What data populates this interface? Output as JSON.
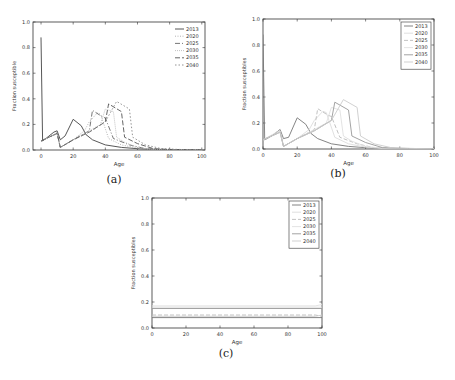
{
  "chart_data": [
    {
      "id": "a",
      "caption": "(a)",
      "type": "line",
      "title": "",
      "xlabel": "Age",
      "ylabel": "Fraction susceptible",
      "xlim": [
        -5,
        102
      ],
      "ylim": [
        0,
        1.0
      ],
      "xticks": [
        0,
        20,
        40,
        60,
        80,
        100
      ],
      "yticks": [
        0.0,
        0.2,
        0.4,
        0.6,
        0.8,
        1.0
      ],
      "grid": false,
      "legend_position": "upper right",
      "legend_frame": false,
      "box": {
        "x": 33,
        "y": 22,
        "w": 172,
        "h": 128
      },
      "series": [
        {
          "name": "2013",
          "dash": "",
          "color": "#444444",
          "x": [
            0,
            1,
            3,
            8,
            10,
            12,
            15,
            20,
            25,
            28,
            32,
            40,
            50,
            60,
            70,
            100
          ],
          "y": [
            0.88,
            0.07,
            0.09,
            0.14,
            0.15,
            0.08,
            0.11,
            0.24,
            0.19,
            0.12,
            0.08,
            0.04,
            0.02,
            0.01,
            0.005,
            0.0
          ]
        },
        {
          "name": "2020",
          "dash": "1,1.5",
          "color": "#aaaaaa",
          "x": [
            0,
            8,
            10,
            12,
            20,
            27,
            30,
            35,
            37,
            42,
            50,
            60,
            70,
            100
          ],
          "y": [
            0.07,
            0.12,
            0.14,
            0.02,
            0.08,
            0.15,
            0.22,
            0.29,
            0.28,
            0.09,
            0.04,
            0.015,
            0.005,
            0.0
          ]
        },
        {
          "name": "2025",
          "dash": "5,2,1,2",
          "color": "#666666",
          "x": [
            0,
            10,
            12,
            20,
            30,
            32,
            38,
            40,
            45,
            55,
            65,
            75,
            100
          ],
          "y": [
            0.07,
            0.13,
            0.02,
            0.08,
            0.15,
            0.31,
            0.26,
            0.25,
            0.09,
            0.04,
            0.01,
            0.005,
            0.0
          ]
        },
        {
          "name": "2030",
          "dash": "1,1",
          "color": "#bbbbbb",
          "x": [
            0,
            10,
            12,
            20,
            30,
            37,
            40,
            45,
            47,
            52,
            60,
            70,
            100
          ],
          "y": [
            0.07,
            0.13,
            0.02,
            0.08,
            0.15,
            0.2,
            0.32,
            0.3,
            0.1,
            0.06,
            0.02,
            0.005,
            0.0
          ]
        },
        {
          "name": "2035",
          "dash": "5,2",
          "color": "#555555",
          "x": [
            0,
            10,
            12,
            20,
            30,
            40,
            42,
            50,
            52,
            60,
            70,
            80,
            100
          ],
          "y": [
            0.07,
            0.13,
            0.02,
            0.08,
            0.14,
            0.22,
            0.36,
            0.3,
            0.1,
            0.05,
            0.01,
            0.005,
            0.0
          ]
        },
        {
          "name": "2040",
          "dash": "1.5,2",
          "color": "#888888",
          "x": [
            0,
            10,
            12,
            20,
            30,
            40,
            47,
            55,
            57,
            65,
            75,
            85,
            100
          ],
          "y": [
            0.07,
            0.13,
            0.02,
            0.08,
            0.14,
            0.22,
            0.38,
            0.32,
            0.1,
            0.04,
            0.01,
            0.005,
            0.0
          ]
        }
      ]
    },
    {
      "id": "b",
      "caption": "(b)",
      "type": "line",
      "title": "",
      "xlabel": "Age",
      "ylabel": "Fraction susceptibles",
      "xlim": [
        0,
        100
      ],
      "ylim": [
        0,
        1.0
      ],
      "xticks": [
        0,
        20,
        40,
        60,
        80,
        100
      ],
      "yticks": [
        0.0,
        0.2,
        0.4,
        0.6,
        0.8,
        1.0
      ],
      "grid": false,
      "legend_position": "upper right",
      "legend_frame": true,
      "box": {
        "x": 263,
        "y": 19,
        "w": 171,
        "h": 130
      },
      "series": [
        {
          "name": "2013",
          "dash": "",
          "color": "#777777",
          "x": [
            0,
            1,
            5,
            10,
            12,
            15,
            20,
            25,
            28,
            32,
            40,
            50,
            60,
            70,
            100
          ],
          "y": [
            0.88,
            0.07,
            0.1,
            0.15,
            0.08,
            0.09,
            0.24,
            0.19,
            0.12,
            0.08,
            0.04,
            0.02,
            0.01,
            0.005,
            0.0
          ]
        },
        {
          "name": "2020",
          "dash": "",
          "color": "#dddddd",
          "x": [
            0,
            8,
            10,
            12,
            20,
            27,
            30,
            35,
            37,
            42,
            50,
            60,
            70,
            100
          ],
          "y": [
            0.07,
            0.13,
            0.14,
            0.02,
            0.08,
            0.15,
            0.22,
            0.29,
            0.28,
            0.09,
            0.04,
            0.015,
            0.005,
            0.0
          ]
        },
        {
          "name": "2025",
          "dash": "4,2",
          "color": "#bbbbbb",
          "x": [
            0,
            10,
            12,
            20,
            30,
            32,
            38,
            40,
            45,
            55,
            65,
            75,
            100
          ],
          "y": [
            0.07,
            0.13,
            0.02,
            0.08,
            0.15,
            0.31,
            0.26,
            0.25,
            0.09,
            0.04,
            0.01,
            0.005,
            0.0
          ]
        },
        {
          "name": "2030",
          "dash": "",
          "color": "#e0e0e0",
          "x": [
            0,
            10,
            12,
            20,
            30,
            37,
            40,
            45,
            47,
            52,
            60,
            70,
            100
          ],
          "y": [
            0.07,
            0.13,
            0.02,
            0.08,
            0.15,
            0.2,
            0.32,
            0.3,
            0.1,
            0.06,
            0.02,
            0.005,
            0.0
          ]
        },
        {
          "name": "2035",
          "dash": "",
          "color": "#999999",
          "x": [
            0,
            10,
            12,
            20,
            30,
            40,
            42,
            50,
            52,
            60,
            70,
            80,
            100
          ],
          "y": [
            0.07,
            0.13,
            0.02,
            0.08,
            0.14,
            0.22,
            0.36,
            0.3,
            0.1,
            0.05,
            0.01,
            0.005,
            0.0
          ]
        },
        {
          "name": "2040",
          "dash": "",
          "color": "#cccccc",
          "x": [
            0,
            10,
            12,
            20,
            30,
            40,
            47,
            55,
            57,
            65,
            75,
            85,
            100
          ],
          "y": [
            0.07,
            0.13,
            0.02,
            0.08,
            0.14,
            0.22,
            0.38,
            0.32,
            0.1,
            0.04,
            0.01,
            0.005,
            0.0
          ]
        }
      ]
    },
    {
      "id": "c",
      "caption": "(c)",
      "type": "line",
      "title": "",
      "xlabel": "Age",
      "ylabel": "Fraction susceptibles",
      "xlim": [
        0,
        100
      ],
      "ylim": [
        0,
        1.0
      ],
      "xticks": [
        0,
        20,
        40,
        60,
        80,
        100
      ],
      "yticks": [
        0.0,
        0.2,
        0.4,
        0.6,
        0.8,
        1.0
      ],
      "grid": false,
      "legend_position": "upper right",
      "legend_frame": true,
      "box": {
        "x": 152,
        "y": 198,
        "w": 170,
        "h": 130
      },
      "series": [
        {
          "name": "2013",
          "dash": "",
          "color": "#777777",
          "x": [
            0,
            100
          ],
          "y": [
            0.08,
            0.08
          ]
        },
        {
          "name": "2020",
          "dash": "",
          "color": "#dddddd",
          "x": [
            0,
            100
          ],
          "y": [
            0.16,
            0.16
          ]
        },
        {
          "name": "2025",
          "dash": "4,2",
          "color": "#bbbbbb",
          "x": [
            0,
            96,
            100
          ],
          "y": [
            0.1,
            0.1,
            0.09
          ]
        },
        {
          "name": "2030",
          "dash": "",
          "color": "#e0e0e0",
          "x": [
            0,
            96,
            100
          ],
          "y": [
            0.17,
            0.17,
            0.18
          ]
        },
        {
          "name": "2035",
          "dash": "",
          "color": "#999999",
          "x": [
            0,
            100
          ],
          "y": [
            0.15,
            0.15
          ]
        },
        {
          "name": "2040",
          "dash": "",
          "color": "#cccccc",
          "x": [
            0,
            96,
            100
          ],
          "y": [
            0.09,
            0.09,
            0.1
          ]
        }
      ]
    }
  ],
  "captions": {
    "a": "(a)",
    "b": "(b)",
    "c": "(c)"
  }
}
